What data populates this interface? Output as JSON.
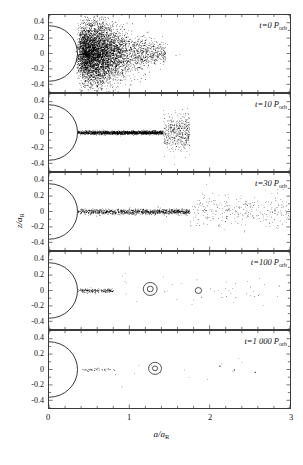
{
  "figure": {
    "width": 303,
    "height": 465,
    "background": "#ffffff",
    "frame_color": "#3a3a3a",
    "marker_color": "#000000"
  },
  "axes": {
    "x": {
      "label_text": "a/a",
      "label_sub": "R",
      "min": 0,
      "max": 3,
      "major_ticks": [
        0,
        1,
        2,
        3
      ],
      "major_tick_labels": [
        "0",
        "1",
        "2",
        "3"
      ],
      "minor_tick_step": 0.2
    },
    "y": {
      "label_text": "z/a",
      "label_sub": "R",
      "min": -0.5,
      "max": 0.5,
      "major_ticks": [
        -0.4,
        -0.2,
        0,
        0.2,
        0.4
      ],
      "major_tick_labels": [
        "-0.4",
        "-0.2",
        "0",
        "0.2",
        "0.4"
      ],
      "minor_tick_step": 0.1
    }
  },
  "chart_data": {
    "type": "scatter",
    "title": "",
    "xlabel": "a/a_R",
    "ylabel": "z/a_R",
    "xlim": [
      0,
      3
    ],
    "ylim": [
      -0.5,
      0.5
    ],
    "grid": false,
    "legend": "none",
    "panel_count": 5,
    "shared_x_axis": true,
    "planet_arc": {
      "description": "semicircular arc representing central planet / inner boundary",
      "center_x": 0,
      "center_y": 0,
      "radius_x": 0.355,
      "radius_y": 0.36,
      "drawn_in_all_panels": true
    },
    "panels": [
      {
        "index": 0,
        "label": "t=0 P",
        "label_sub": "orb",
        "time_value": 0,
        "time_unit": "P_orb",
        "n_points_approx": 6000,
        "description": "Dense isotropic cloud of particles concentrated between a/a_R 0.35 and 1.1, vertically spread over the full z range -0.5 to 0.5, densest near z=0 and a/a_R 0.5-0.8",
        "distribution": {
          "a_core_min": 0.33,
          "a_core_max": 1.05,
          "a_tail_max": 1.45,
          "z_sigma": 0.17,
          "a_peak": 0.62
        }
      },
      {
        "index": 1,
        "label": "t=10 P",
        "label_sub": "orb",
        "time_value": 10,
        "time_unit": "P_orb",
        "n_points_approx": 2400,
        "description": "Particles collapsed into a thin flat disk near z=0 from a/a_R 0.35 to about 1.45, with a sparse scatter of high-inclination particles up to z=+/-0.3 between a/a_R 0.9 and 1.5",
        "distribution": {
          "a_core_min": 0.35,
          "a_core_max": 1.42,
          "a_tail_max": 1.75,
          "z_sigma": 0.012,
          "a_peak": 0.9
        }
      },
      {
        "index": 2,
        "label": "t=30 P",
        "label_sub": "orb",
        "time_value": 30,
        "time_unit": "P_orb",
        "n_points_approx": 1500,
        "description": "Thin disk spread further out to a/a_R ~ 2.0, with a diffuse scattered halo of particles reaching a/a_R = 3 and z up to +/-0.3",
        "distribution": {
          "a_core_min": 0.35,
          "a_core_max": 1.75,
          "a_tail_max": 3.0,
          "z_sigma": 0.018,
          "a_peak": 0.85
        }
      },
      {
        "index": 3,
        "label": "t=100 P",
        "label_sub": "orb",
        "time_value": 100,
        "time_unit": "P_orb",
        "n_points_approx": 260,
        "description": "Compact inner ring from a/a_R 0.35 to 0.8 near z=0, plus widely scattered individual particles out to a/a_R = 3; two ringed accreted bodies visible at a/a_R ~ 1.26 and ~ 1.85",
        "distribution": {
          "a_core_min": 0.36,
          "a_core_max": 0.8,
          "a_tail_max": 3.0,
          "z_sigma": 0.014,
          "a_peak": 0.6
        },
        "ringed_bodies": [
          {
            "a": 1.26,
            "z": 0.02,
            "outer_radius_px": 7,
            "inner_radius_px": 3
          },
          {
            "a": 1.86,
            "z": 0.0,
            "outer_radius_px": 3.2,
            "inner_radius_px": 0
          }
        ]
      },
      {
        "index": 4,
        "label": "t=1 000 P",
        "label_sub": "orb",
        "time_value": 1000,
        "time_unit": "P_orb",
        "n_points_approx": 70,
        "description": "Narrow residual ring between a/a_R 0.38 and 0.82 at z~0, one ringed satellite at a/a_R ~ 1.32, and three isolated particles near a/a_R 2.1, 2.3 and 2.55",
        "distribution": {
          "a_core_min": 0.38,
          "a_core_max": 0.82,
          "a_tail_max": 2.6,
          "z_sigma": 0.01,
          "a_peak": 0.6
        },
        "ringed_bodies": [
          {
            "a": 1.32,
            "z": 0.015,
            "outer_radius_px": 6.5,
            "inner_radius_px": 2.6
          }
        ],
        "isolated_points": [
          {
            "a": 2.12,
            "z": 0.05
          },
          {
            "a": 2.3,
            "z": 0.0
          },
          {
            "a": 2.56,
            "z": -0.03
          }
        ]
      }
    ]
  }
}
